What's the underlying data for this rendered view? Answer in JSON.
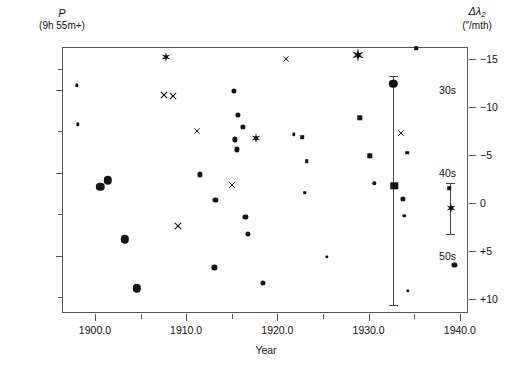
{
  "chart_data": {
    "type": "scatter",
    "title": "",
    "xlabel": "Year",
    "ylabel_left_symbol": "P",
    "ylabel_left_units": "(9h 55m+)",
    "ylabel_right_symbol": "Δλ",
    "ylabel_right_subscript": "2",
    "ylabel_right_units": "(″/mth)",
    "xlim": [
      1896.5,
      1941.0
    ],
    "ylim_left": [
      25.0,
      57.0
    ],
    "ylim_right": [
      -16.2,
      11.6
    ],
    "grid": false,
    "legend": "none",
    "xticks_major": [
      {
        "value": 1900,
        "label": "1900.0"
      },
      {
        "value": 1910,
        "label": "1910.0"
      },
      {
        "value": 1920,
        "label": "1920.0"
      },
      {
        "value": 1930,
        "label": "1930.0"
      },
      {
        "value": 1940,
        "label": "1940.0"
      }
    ],
    "xticks_minor": [
      1905,
      1915,
      1925,
      1935
    ],
    "yticks_left_major": [
      {
        "value": 30,
        "label": "30s"
      },
      {
        "value": 40,
        "label": "40s"
      },
      {
        "value": 50,
        "label": "50s"
      }
    ],
    "yticks_left_minor": [
      27.5,
      35,
      45,
      55
    ],
    "yticks_right_major": [
      {
        "value": -15,
        "label": "−15"
      },
      {
        "value": -10,
        "label": "−10"
      },
      {
        "value": -5,
        "label": "−5"
      },
      {
        "value": 0,
        "label": "0"
      },
      {
        "value": 5,
        "label": "+5"
      },
      {
        "value": 10,
        "label": "+10"
      }
    ],
    "marker_types": [
      "dot-small",
      "dot-medium",
      "dot-large",
      "square-small",
      "square-medium",
      "square-large",
      "cross",
      "star"
    ],
    "points": [
      {
        "x": 1898.0,
        "y": 29.5,
        "marker": "dot-small"
      },
      {
        "x": 1898.1,
        "y": 34.2,
        "marker": "dot-small"
      },
      {
        "x": 1900.6,
        "y": 41.7,
        "marker": "dot-large"
      },
      {
        "x": 1901.4,
        "y": 40.9,
        "marker": "dot-large"
      },
      {
        "x": 1903.3,
        "y": 48.0,
        "marker": "dot-large"
      },
      {
        "x": 1904.6,
        "y": 53.9,
        "marker": "dot-large"
      },
      {
        "x": 1907.8,
        "y": 26.1,
        "marker": "star"
      },
      {
        "x": 1907.6,
        "y": 30.6,
        "marker": "cross"
      },
      {
        "x": 1908.6,
        "y": 30.8,
        "marker": "cross"
      },
      {
        "x": 1909.1,
        "y": 46.4,
        "marker": "cross"
      },
      {
        "x": 1911.2,
        "y": 35.0,
        "marker": "cross"
      },
      {
        "x": 1911.5,
        "y": 40.2,
        "marker": "dot-medium"
      },
      {
        "x": 1913.2,
        "y": 43.3,
        "marker": "dot-medium"
      },
      {
        "x": 1913.1,
        "y": 51.4,
        "marker": "dot-medium"
      },
      {
        "x": 1915.2,
        "y": 30.2,
        "marker": "dot-medium"
      },
      {
        "x": 1915.7,
        "y": 33.0,
        "marker": "dot-medium"
      },
      {
        "x": 1916.2,
        "y": 34.5,
        "marker": "dot-medium"
      },
      {
        "x": 1915.3,
        "y": 36.0,
        "marker": "dot-medium"
      },
      {
        "x": 1915.6,
        "y": 37.2,
        "marker": "dot-medium"
      },
      {
        "x": 1917.6,
        "y": 35.8,
        "marker": "star"
      },
      {
        "x": 1915.0,
        "y": 41.5,
        "marker": "cross"
      },
      {
        "x": 1916.5,
        "y": 45.3,
        "marker": "dot-medium"
      },
      {
        "x": 1916.8,
        "y": 47.4,
        "marker": "dot-medium"
      },
      {
        "x": 1918.4,
        "y": 53.3,
        "marker": "dot-medium"
      },
      {
        "x": 1920.9,
        "y": 26.3,
        "marker": "cross"
      },
      {
        "x": 1921.8,
        "y": 35.4,
        "marker": "dot-small"
      },
      {
        "x": 1922.7,
        "y": 35.7,
        "marker": "square-small"
      },
      {
        "x": 1923.2,
        "y": 38.6,
        "marker": "square-small"
      },
      {
        "x": 1923.0,
        "y": 42.4,
        "marker": "square-small"
      },
      {
        "x": 1925.4,
        "y": 50.1,
        "marker": "dot-small"
      },
      {
        "x": 1928.8,
        "y": 25.9,
        "marker": "star"
      },
      {
        "x": 1929.0,
        "y": 33.4,
        "marker": "square-medium"
      },
      {
        "x": 1930.1,
        "y": 38.0,
        "marker": "square-medium"
      },
      {
        "x": 1930.6,
        "y": 41.3,
        "marker": "dot-small"
      },
      {
        "x": 1932.7,
        "y": 29.3,
        "marker": "dot-large"
      },
      {
        "x": 1933.6,
        "y": 35.2,
        "marker": "cross"
      },
      {
        "x": 1932.8,
        "y": 41.6,
        "marker": "square-large"
      },
      {
        "x": 1934.2,
        "y": 37.6,
        "marker": "square-small"
      },
      {
        "x": 1933.8,
        "y": 43.2,
        "marker": "dot-medium"
      },
      {
        "x": 1933.9,
        "y": 45.2,
        "marker": "dot-small"
      },
      {
        "x": 1934.3,
        "y": 54.2,
        "marker": "dot-small"
      },
      {
        "x": 1935.2,
        "y": 25.0,
        "marker": "square-small"
      },
      {
        "x": 1938.8,
        "y": 41.9,
        "marker": "square-small"
      },
      {
        "x": 1939.1,
        "y": 44.2,
        "marker": "square-small"
      },
      {
        "x": 1939.0,
        "y": 44.3,
        "marker": "star"
      },
      {
        "x": 1939.4,
        "y": 51.1,
        "marker": "dot-medium"
      }
    ],
    "error_bars": [
      {
        "x": 1932.7,
        "y_low": 56.0,
        "y_high": 28.4,
        "center_marker": "dot-large",
        "center_y": 29.3
      },
      {
        "x": 1939.0,
        "y_low": 47.5,
        "y_high": 41.2,
        "center_marker": "star",
        "center_y": 44.3
      }
    ]
  }
}
